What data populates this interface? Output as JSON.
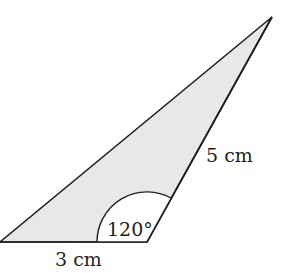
{
  "diagram": {
    "type": "triangle",
    "fill_color": "#e8e8e8",
    "stroke_color": "#231f20",
    "vertices": {
      "top": [
        272,
        17
      ],
      "bottom_left": [
        0,
        242
      ],
      "bottom_right": [
        147,
        242
      ]
    },
    "labels": {
      "base": "3 cm",
      "side": "5 cm",
      "angle": "120°"
    }
  }
}
